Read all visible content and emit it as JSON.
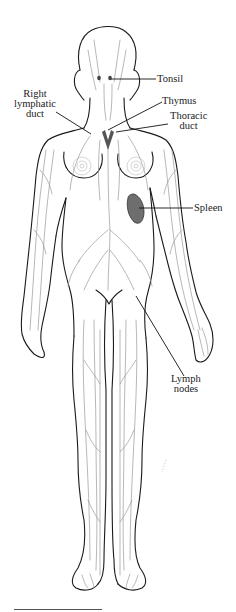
{
  "figure": {
    "colors": {
      "outline": "#1a1a1a",
      "vessels": "#9a9a9a",
      "organ_fill": "#6e6e6e",
      "background": "#ffffff"
    },
    "labels": [
      {
        "id": "tonsil",
        "lines": [
          "Tonsil"
        ]
      },
      {
        "id": "right-lymphatic-duct",
        "lines": [
          "Right",
          "lymphatic",
          "duct"
        ]
      },
      {
        "id": "thymus",
        "lines": [
          "Thymus"
        ]
      },
      {
        "id": "thoracic-duct",
        "lines": [
          "Thoracic",
          "duct"
        ]
      },
      {
        "id": "spleen",
        "lines": [
          "Spleen"
        ]
      },
      {
        "id": "lymph-nodes",
        "lines": [
          "Lymph",
          "nodes"
        ]
      }
    ]
  }
}
